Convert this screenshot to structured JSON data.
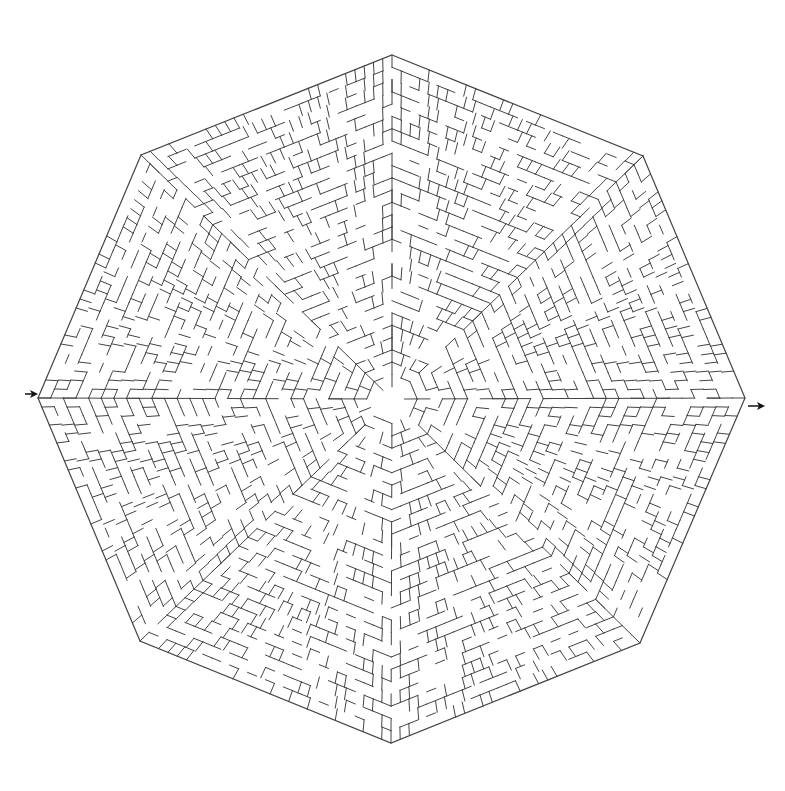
{
  "puzzle": {
    "type": "octagonal-maze",
    "center": [
      392,
      399
    ],
    "outline": [
      [
        392,
        55
      ],
      [
        643,
        156
      ],
      [
        745,
        398
      ],
      [
        640,
        643
      ],
      [
        391,
        743
      ],
      [
        140,
        641
      ],
      [
        38,
        398
      ],
      [
        141,
        155
      ]
    ],
    "entrance": {
      "label": "entrance-arrow",
      "x1": 25,
      "y1": 394,
      "x2": 38,
      "y2": 394
    },
    "exit": {
      "label": "exit-arrow",
      "x1": 748,
      "y1": 406,
      "x2": 765,
      "y2": 406
    },
    "rings": 28,
    "seed": 7,
    "colors": {
      "wall": "#444444",
      "arrow": "#111111",
      "background": "#ffffff"
    }
  }
}
